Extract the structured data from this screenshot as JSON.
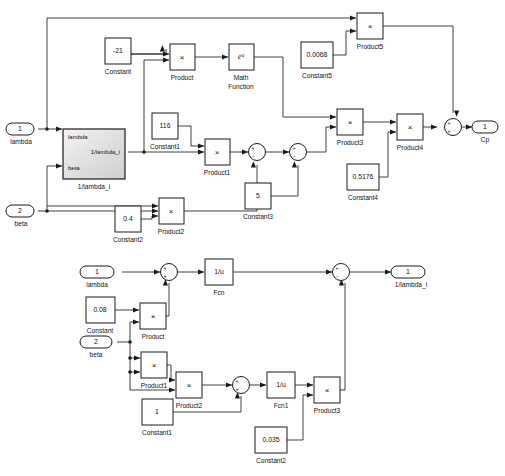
{
  "diagram": {
    "kind": "simulink-block-diagram",
    "caption": "",
    "colors": {
      "line": "#2a2a2a",
      "block_stroke": "#1a1a1a",
      "block_fill": "#ffffff",
      "background": "#ffffff",
      "subsystem_fill": "#e9e9e9"
    }
  },
  "top": {
    "title": "Cp",
    "inports": [
      {
        "num": "1",
        "label": "lambda"
      },
      {
        "num": "2",
        "label": "beta"
      }
    ],
    "outports": [
      {
        "num": "1",
        "label": "Cp"
      }
    ],
    "subsystem": {
      "name": "1/lambda_i",
      "in_ports": [
        "lambda",
        "beta"
      ],
      "out_ports": [
        "1/lambda_i"
      ]
    },
    "constants": [
      {
        "name": "Constant",
        "value": "-21"
      },
      {
        "name": "Constant5",
        "value": "0.0068"
      },
      {
        "name": "Constant1",
        "value": "116"
      },
      {
        "name": "Constant4",
        "value": "0.5176"
      },
      {
        "name": "Constant3",
        "value": "5"
      },
      {
        "name": "Constant2",
        "value": "0.4"
      }
    ],
    "products": [
      {
        "name": "Product",
        "symbol": "×"
      },
      {
        "name": "Product5",
        "symbol": "×"
      },
      {
        "name": "Product1",
        "symbol": "×"
      },
      {
        "name": "Product2",
        "symbol": "×"
      },
      {
        "name": "Product3",
        "symbol": "×"
      },
      {
        "name": "Product4",
        "symbol": "×"
      }
    ],
    "math_function": {
      "name": "Math\nFunction",
      "name_line1": "Math",
      "name_line2": "Function",
      "symbol": "eᵘ"
    },
    "sums": [
      {
        "name": "Sum",
        "signs": "+-"
      },
      {
        "name": "Sum1",
        "signs": "+-"
      },
      {
        "name": "Sum2",
        "signs": "++"
      }
    ]
  },
  "bottom": {
    "title": "1/lambda_i",
    "inports": [
      {
        "num": "1",
        "label": "lambda"
      },
      {
        "num": "2",
        "label": "beta"
      }
    ],
    "outports": [
      {
        "num": "1",
        "label": "1/lambda_i"
      }
    ],
    "constants": [
      {
        "name": "Constant",
        "value": "0.08"
      },
      {
        "name": "Constant1",
        "value": "1"
      },
      {
        "name": "Constant2",
        "value": "0.035"
      }
    ],
    "products": [
      {
        "name": "Product",
        "symbol": "×"
      },
      {
        "name": "Product1",
        "symbol": "×"
      },
      {
        "name": "Product2",
        "symbol": "×"
      },
      {
        "name": "Product3",
        "symbol": "×"
      }
    ],
    "fcns": [
      {
        "name": "Fcn",
        "expr": "1/u"
      },
      {
        "name": "Fcn1",
        "expr": "1/u"
      }
    ],
    "sums": [
      {
        "name": "Sum",
        "signs": "++"
      },
      {
        "name": "Sum1",
        "signs": "++"
      },
      {
        "name": "Sum2",
        "signs": "+-"
      }
    ]
  }
}
